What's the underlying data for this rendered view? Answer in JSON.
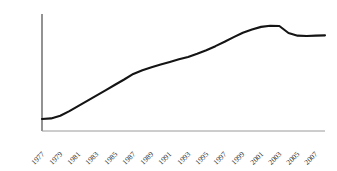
{
  "chart_data": {
    "type": "line",
    "title": "",
    "subtitle": "",
    "xlabel": "",
    "ylabel": "",
    "legend": [],
    "legend_position": "none",
    "grid": false,
    "background_color": "#ffffff",
    "line_color": "#141414",
    "axis_color": "#3a3a3a",
    "xaxis_color": "#9a9a9a",
    "ylim": [
      0,
      4000
    ],
    "yticks": [
      0,
      500,
      1000,
      1500,
      2000,
      2500,
      3000,
      3500,
      4000
    ],
    "ytick_labels": [
      "0",
      "500",
      "1000",
      "1500",
      "2000",
      "2500",
      "3000",
      "3500",
      "4000"
    ],
    "xticks": [
      1977,
      1979,
      1981,
      1983,
      1985,
      1987,
      1989,
      1991,
      1993,
      1995,
      1997,
      1999,
      2001,
      2003,
      2005,
      2007
    ],
    "xtick_labels": [
      "1977",
      "1979",
      "1981",
      "1983",
      "1985",
      "1987",
      "1989",
      "1991",
      "1993",
      "1995",
      "1997",
      "1999",
      "2001",
      "2003",
      "2005",
      "2007"
    ],
    "xtick_rotation": -45,
    "x": [
      1977,
      1978,
      1979,
      1980,
      1981,
      1982,
      1983,
      1984,
      1985,
      1986,
      1987,
      1988,
      1989,
      1990,
      1991,
      1992,
      1993,
      1994,
      1995,
      1996,
      1997,
      1998,
      1999,
      2000,
      2001,
      2002,
      2003,
      2004,
      2005,
      2006,
      2007,
      2008
    ],
    "values": [
      410,
      430,
      520,
      680,
      860,
      1040,
      1220,
      1400,
      1580,
      1760,
      1950,
      2080,
      2180,
      2270,
      2360,
      2450,
      2530,
      2640,
      2760,
      2900,
      3050,
      3210,
      3360,
      3470,
      3560,
      3600,
      3590,
      3350,
      3260,
      3250,
      3260,
      3270
    ]
  },
  "geometry": {
    "plot_left": 42,
    "plot_right": 325,
    "plot_top": 14,
    "plot_bottom": 131
  }
}
